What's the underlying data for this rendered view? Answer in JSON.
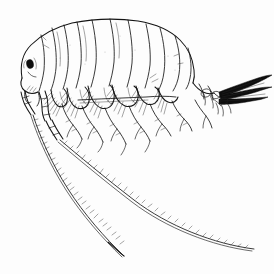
{
  "figure": {
    "subject_common_name": "amphipod (scud)",
    "orientation": "lateral view, head to the left, tail to the right",
    "medium": "black ink stipple and line engraving on white ground",
    "canvas": {
      "width": 274,
      "height": 274,
      "background_color": "#fdfdfd"
    },
    "ink_color": "#141414",
    "caption_text": ""
  },
  "anatomy": {
    "head": {
      "label": "head (cephalon)",
      "eye_label": "compound eye",
      "eye_color": "#0d0d0d",
      "eye_center": [
        30,
        64
      ],
      "eye_radius": 3.2
    },
    "pereon": {
      "label": "pereon (thorax)",
      "segment_count": 7,
      "segment_labels": [
        "pereonite 1",
        "pereonite 2",
        "pereonite 3",
        "pereonite 4",
        "pereonite 5",
        "pereonite 6",
        "pereonite 7"
      ]
    },
    "pleon": {
      "label": "pleon (abdomen)",
      "segment_count": 3,
      "segment_labels": [
        "pleonite 1",
        "pleonite 2",
        "pleonite 3"
      ]
    },
    "urosome": {
      "label": "urosome",
      "segment_count": 3
    },
    "antenna_1": {
      "label": "antenna 1 (first antenna)",
      "description": "long flagellum sweeping down and right, ending low-left of centre",
      "tip_point": [
        124,
        256
      ],
      "article_count": 42
    },
    "antenna_2": {
      "label": "antenna 2 (second antenna)",
      "description": "longer flagellum sweeping down and right to lower-right corner",
      "tip_point": [
        254,
        249
      ],
      "article_count": 55
    },
    "gnathopods": {
      "label": "gnathopods",
      "count": 2
    },
    "pereopods": {
      "label": "pereopods (walking legs)",
      "count": 5
    },
    "coxal_plates": {
      "label": "coxal plates",
      "count": 6,
      "setae_label": "marginal setae fringe"
    },
    "uropods": {
      "label": "uropods",
      "count": 3,
      "description": "dense dark setal brush projecting posteriorly to right margin",
      "fill_color": "#0d0d0d"
    },
    "telson": {
      "label": "telson"
    }
  },
  "legend": {
    "scale_bar_present": false,
    "labels_present": false
  }
}
